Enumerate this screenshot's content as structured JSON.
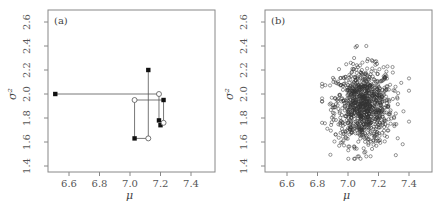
{
  "chart_data": [
    {
      "id": "a",
      "type": "line",
      "panel_label": "(a)",
      "title": "",
      "xlabel": "μ",
      "ylabel": "σ²",
      "xlim": [
        6.46,
        7.54
      ],
      "ylim": [
        1.35,
        2.7
      ],
      "xticks": [
        6.6,
        6.8,
        7.0,
        7.2,
        7.4
      ],
      "xtick_labels": [
        "6.6",
        "6.8",
        "7.0",
        "7.2",
        "7.4"
      ],
      "yticks": [
        1.4,
        1.6,
        1.8,
        2.0,
        2.2,
        2.4,
        2.6
      ],
      "ytick_labels": [
        "1.4",
        "1.6",
        "1.8",
        "2.0",
        "2.2",
        "2.4",
        "2.6"
      ],
      "grid": false,
      "description": "Gibbs sampler trace: alternating horizontal (mu) and vertical (sigma^2) moves; filled squares and open circles",
      "path": [
        {
          "mu": 6.51,
          "sigma2": 2.0,
          "marker": "filled-square"
        },
        {
          "mu": 7.19,
          "sigma2": 2.0,
          "marker": "open-circle"
        },
        {
          "mu": 7.19,
          "sigma2": 1.78,
          "marker": "filled-square"
        },
        {
          "mu": 7.22,
          "sigma2": 1.76,
          "marker": "open-circle"
        },
        {
          "mu": 7.22,
          "sigma2": 1.95,
          "marker": "filled-square"
        },
        {
          "mu": 7.03,
          "sigma2": 1.95,
          "marker": "open-circle"
        },
        {
          "mu": 7.03,
          "sigma2": 1.63,
          "marker": "filled-square"
        },
        {
          "mu": 7.12,
          "sigma2": 1.63,
          "marker": "open-circle"
        },
        {
          "mu": 7.12,
          "sigma2": 2.2,
          "marker": "filled-square"
        }
      ],
      "extra_points": [
        {
          "mu": 7.2,
          "sigma2": 1.74,
          "marker": "filled-square"
        }
      ]
    },
    {
      "id": "b",
      "type": "scatter",
      "panel_label": "(b)",
      "title": "",
      "xlabel": "μ",
      "ylabel": "σ²",
      "xlim": [
        6.46,
        7.54
      ],
      "ylim": [
        1.35,
        2.7
      ],
      "xticks": [
        6.6,
        6.8,
        7.0,
        7.2,
        7.4
      ],
      "xtick_labels": [
        "6.6",
        "6.8",
        "7.0",
        "7.2",
        "7.4"
      ],
      "yticks": [
        1.4,
        1.6,
        1.8,
        2.0,
        2.2,
        2.4,
        2.6
      ],
      "ytick_labels": [
        "1.4",
        "1.6",
        "1.8",
        "2.0",
        "2.2",
        "2.4",
        "2.6"
      ],
      "grid": false,
      "marker": "open-circle",
      "description": "Cloud of ~1000 posterior draws (open circles)",
      "distribution": {
        "n": 1000,
        "mu_mean": 7.1,
        "mu_sd": 0.095,
        "sigma2_mean": 1.9,
        "sigma2_sd": 0.16,
        "mu_range": [
          6.83,
          7.4
        ],
        "sigma2_range": [
          1.46,
          2.4
        ]
      },
      "notable_points": [
        {
          "mu": 6.83,
          "sigma2": 1.76
        },
        {
          "mu": 7.4,
          "sigma2": 2.13
        },
        {
          "mu": 7.4,
          "sigma2": 1.77
        },
        {
          "mu": 7.04,
          "sigma2": 1.46
        },
        {
          "mu": 7.12,
          "sigma2": 1.48
        },
        {
          "mu": 7.12,
          "sigma2": 2.4
        },
        {
          "mu": 7.05,
          "sigma2": 2.39
        }
      ]
    }
  ],
  "colors": {
    "frame": "#888888",
    "line": "#555555",
    "marker": "#111111",
    "scatter": "#333333"
  }
}
